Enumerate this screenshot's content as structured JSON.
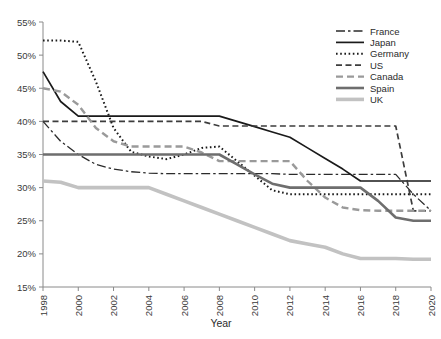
{
  "chart_data": {
    "type": "line",
    "title": "",
    "xlabel": "Year",
    "ylabel": "",
    "xlim": [
      1998,
      2020
    ],
    "ylim": [
      15,
      55
    ],
    "grid": false,
    "legend_position": "top-right",
    "y_tick_labels": [
      "55%",
      "50%",
      "45%",
      "40%",
      "35%",
      "30%",
      "25%",
      "20%",
      "15%"
    ],
    "y_ticks": [
      55,
      50,
      45,
      40,
      35,
      30,
      25,
      20,
      15
    ],
    "x_tick_labels": [
      "1998",
      "2000",
      "2002",
      "2004",
      "2006",
      "2008",
      "2010",
      "2012",
      "2014",
      "2016",
      "2018",
      "2020"
    ],
    "x_ticks": [
      1998,
      2000,
      2002,
      2004,
      2006,
      2008,
      2010,
      2012,
      2014,
      2016,
      2018,
      2020
    ],
    "x": [
      1998,
      1999,
      2000,
      2001,
      2002,
      2003,
      2004,
      2005,
      2006,
      2007,
      2008,
      2009,
      2010,
      2011,
      2012,
      2013,
      2014,
      2015,
      2016,
      2017,
      2018,
      2019,
      2020
    ],
    "series": [
      {
        "name": "France",
        "color": "#2b2b2b",
        "dash": "9,3,2.5,3",
        "width": 1.3,
        "values": [
          40.0,
          37.0,
          35.0,
          33.5,
          32.8,
          32.4,
          32.2,
          32.1,
          32.1,
          32.1,
          32.1,
          32.1,
          32.1,
          32.1,
          32.0,
          32.0,
          32.0,
          32.0,
          32.0,
          32.0,
          32.0,
          29.0,
          26.5
        ]
      },
      {
        "name": "Japan",
        "color": "#1a1a1a",
        "dash": "",
        "width": 1.7,
        "values": [
          47.5,
          43.0,
          40.8,
          40.8,
          40.8,
          40.8,
          40.8,
          40.8,
          40.8,
          40.8,
          40.8,
          40.0,
          39.2,
          38.4,
          37.6,
          36.0,
          34.4,
          32.8,
          31.0,
          31.0,
          31.0,
          31.0,
          31.0
        ]
      },
      {
        "name": "Germany",
        "color": "#1a1a1a",
        "dash": "1.6,2.6",
        "width": 2.0,
        "values": [
          52.2,
          52.2,
          52.0,
          46.0,
          39.0,
          35.4,
          34.7,
          34.3,
          35.0,
          36.0,
          36.2,
          34.0,
          31.8,
          29.6,
          29.0,
          29.0,
          29.0,
          29.0,
          29.0,
          29.0,
          29.0,
          29.0,
          29.0
        ]
      },
      {
        "name": "US",
        "color": "#3d3d3d",
        "dash": "6,3.5",
        "width": 1.7,
        "values": [
          40.0,
          40.0,
          40.0,
          40.0,
          40.0,
          40.0,
          40.0,
          40.0,
          40.0,
          40.0,
          39.3,
          39.3,
          39.3,
          39.3,
          39.3,
          39.3,
          39.3,
          39.3,
          39.3,
          39.3,
          39.3,
          26.5,
          26.5
        ]
      },
      {
        "name": "Canada",
        "color": "#9a9a9a",
        "dash": "7,4",
        "width": 2.4,
        "values": [
          45.0,
          44.5,
          42.5,
          39.0,
          37.0,
          36.2,
          36.2,
          36.2,
          36.2,
          35.3,
          34.0,
          34.0,
          34.0,
          34.0,
          34.0,
          31.0,
          28.5,
          27.0,
          26.6,
          26.5,
          26.5,
          26.5,
          26.5
        ]
      },
      {
        "name": "Spain",
        "color": "#6e6e6e",
        "dash": "",
        "width": 2.6,
        "values": [
          35.0,
          35.0,
          35.0,
          35.0,
          35.0,
          35.0,
          35.0,
          35.0,
          35.0,
          35.0,
          35.0,
          33.5,
          32.0,
          30.6,
          30.0,
          30.0,
          30.0,
          30.0,
          30.0,
          28.0,
          25.5,
          25.0,
          25.0
        ]
      },
      {
        "name": "UK",
        "color": "#c2c2c2",
        "dash": "",
        "width": 3.6,
        "values": [
          31.0,
          30.8,
          30.0,
          30.0,
          30.0,
          30.0,
          30.0,
          29.0,
          28.0,
          27.0,
          26.0,
          25.0,
          24.0,
          23.0,
          22.0,
          21.5,
          21.0,
          20.0,
          19.3,
          19.3,
          19.3,
          19.2,
          19.2
        ]
      }
    ]
  },
  "legend": {
    "items": [
      {
        "label": "France"
      },
      {
        "label": "Japan"
      },
      {
        "label": "Germany"
      },
      {
        "label": "US"
      },
      {
        "label": "Canada"
      },
      {
        "label": "Spain"
      },
      {
        "label": "UK"
      }
    ]
  },
  "axes": {
    "x_title": "Year"
  }
}
